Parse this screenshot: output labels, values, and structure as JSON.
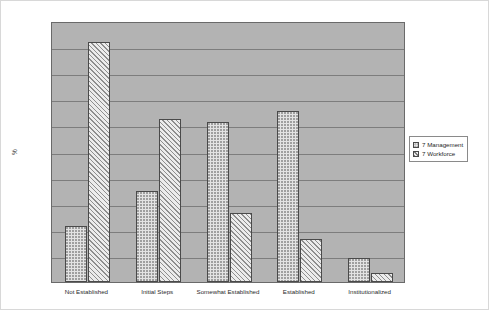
{
  "chart_data": {
    "type": "bar",
    "title": "",
    "xlabel": "",
    "ylabel": "%",
    "ylim": [
      0.0,
      0.5
    ],
    "ytick_step": 0.05,
    "yticks": [
      "0.50",
      "0.45",
      "0.40",
      "0.35",
      "0.30",
      "0.25",
      "0.20",
      "0.15",
      "0.10",
      "0.05",
      "0.00"
    ],
    "ytick_values": [
      0.5,
      0.45,
      0.4,
      0.35,
      0.3,
      0.25,
      0.2,
      0.15,
      0.1,
      0.05,
      0.0
    ],
    "grid": true,
    "grid_axis": "y",
    "legend_position": "right",
    "categories": [
      "Not Established",
      "Initial Steps",
      "Somewhat Established",
      "Established",
      "Institutionalized"
    ],
    "series": [
      {
        "name": "7 Management",
        "pattern": "dotted",
        "values": [
          0.108,
          0.174,
          0.306,
          0.328,
          0.046
        ]
      },
      {
        "name": "7 Workforce",
        "pattern": "diagonal-hatch",
        "values": [
          0.459,
          0.313,
          0.132,
          0.083,
          0.018
        ]
      }
    ]
  },
  "colors": {
    "plot_background": "#b3b3b3",
    "figure_background": "#ffffff",
    "gridline": "#7d7d7d",
    "axis": "#6a6a6a",
    "bar_outline": "#4a4a4a",
    "text": "#2b2b2b"
  }
}
